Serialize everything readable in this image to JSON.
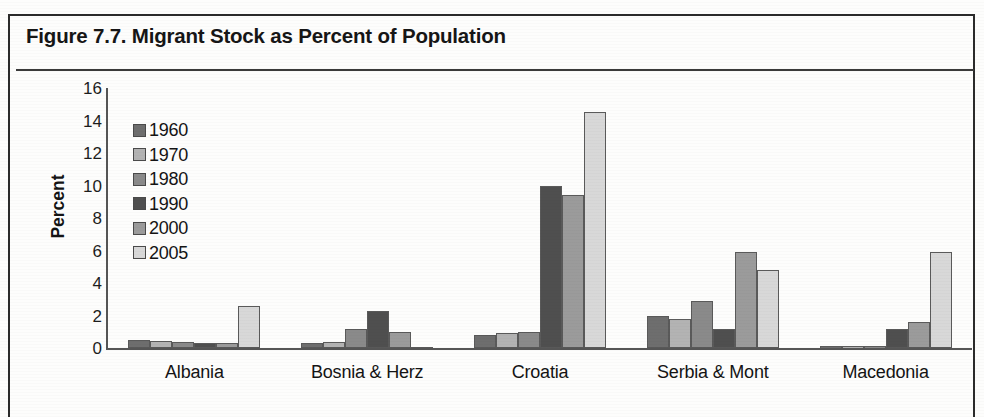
{
  "figure": {
    "title": "Figure 7.7. Migrant Stock as Percent of Population"
  },
  "chart_data": {
    "type": "bar",
    "title": "Figure 7.7. Migrant Stock as Percent of Population",
    "xlabel": "",
    "ylabel": "Percent",
    "ylim": [
      0,
      16
    ],
    "yticks": [
      16,
      14,
      12,
      10,
      8,
      6,
      4,
      2,
      0
    ],
    "grid": false,
    "legend_position": "inside-upper-left",
    "categories": [
      "Albania",
      "Bosnia & Herz",
      "Croatia",
      "Serbia & Mont",
      "Macedonia"
    ],
    "series": [
      {
        "name": "1960",
        "color": "#6e6e6e",
        "values": [
          0.5,
          0.3,
          0.8,
          2.0,
          0.1
        ]
      },
      {
        "name": "1970",
        "color": "#b3b3b3",
        "values": [
          0.45,
          0.35,
          0.9,
          1.8,
          0.1
        ]
      },
      {
        "name": "1980",
        "color": "#8a8a8a",
        "values": [
          0.35,
          1.2,
          1.0,
          2.9,
          0.12
        ]
      },
      {
        "name": "1990",
        "color": "#4f4f4f",
        "values": [
          0.3,
          2.3,
          10.0,
          1.2,
          1.2
        ]
      },
      {
        "name": "2000",
        "color": "#9b9b9b",
        "values": [
          0.3,
          1.0,
          9.4,
          5.9,
          1.6
        ]
      },
      {
        "name": "2005",
        "color": "#d8d8d8",
        "values": [
          2.6,
          0.05,
          14.5,
          4.8,
          5.9
        ]
      }
    ]
  }
}
